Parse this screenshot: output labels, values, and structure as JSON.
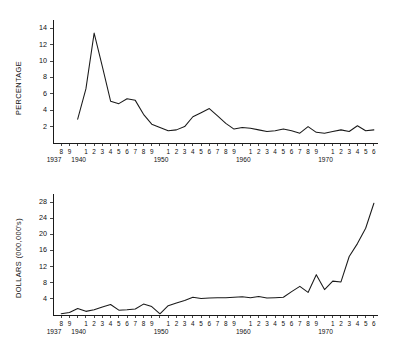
{
  "figure": {
    "background_color": "#ffffff",
    "line_color": "#1a1a1a",
    "axis_color": "#1a1a1a"
  },
  "chart_data": [
    {
      "id": "top",
      "type": "line",
      "title": "",
      "xlabel": "",
      "ylabel": "PERCENTAGE",
      "ylim": [
        0,
        15
      ],
      "xlim": [
        1937,
        1976.5
      ],
      "grid": false,
      "legend": null,
      "yticks": [
        2,
        4,
        6,
        8,
        10,
        12,
        14
      ],
      "ytick_labels": [
        "2",
        "4",
        "6",
        "8",
        "10",
        "12",
        "14"
      ],
      "x_tick_years": [
        1938,
        1939,
        1940,
        1941,
        1942,
        1943,
        1944,
        1945,
        1946,
        1947,
        1948,
        1949,
        1950,
        1951,
        1952,
        1953,
        1954,
        1955,
        1956,
        1957,
        1958,
        1959,
        1960,
        1961,
        1962,
        1963,
        1964,
        1965,
        1966,
        1967,
        1968,
        1969,
        1970,
        1971,
        1972,
        1973,
        1974,
        1975,
        1976
      ],
      "x_tick_labels": [
        "8",
        "9",
        "1940",
        "1",
        "2",
        "3",
        "4",
        "5",
        "6",
        "7",
        "8",
        "9",
        "1950",
        "1",
        "2",
        "3",
        "4",
        "5",
        "6",
        "7",
        "8",
        "9",
        "1960",
        "1",
        "2",
        "3",
        "4",
        "5",
        "6",
        "7",
        "8",
        "9",
        "1970",
        "1",
        "2",
        "3",
        "4",
        "5",
        "6"
      ],
      "x_digit_labels": [
        "8",
        "9",
        "",
        "1",
        "2",
        "3",
        "4",
        "5",
        "6",
        "7",
        "8",
        "9",
        "",
        "1",
        "2",
        "3",
        "4",
        "5",
        "6",
        "7",
        "8",
        "9",
        "",
        "1",
        "2",
        "3",
        "4",
        "5",
        "6",
        "7",
        "8",
        "9",
        "",
        "1",
        "2",
        "3",
        "4",
        "5",
        "6"
      ],
      "decade_anchors": [
        {
          "year": 1937,
          "label": "1937"
        },
        {
          "year": 1940,
          "label": "1940"
        },
        {
          "year": 1950,
          "label": "1950"
        },
        {
          "year": 1960,
          "label": "1960"
        },
        {
          "year": 1970,
          "label": "1970"
        }
      ],
      "x": [
        1940,
        1941,
        1942,
        1943,
        1944,
        1945,
        1946,
        1947,
        1948,
        1949,
        1950,
        1951,
        1952,
        1953,
        1954,
        1955,
        1956,
        1957,
        1958,
        1959,
        1960,
        1961,
        1962,
        1963,
        1964,
        1965,
        1966,
        1967,
        1968,
        1969,
        1970,
        1971,
        1972,
        1973,
        1974,
        1975,
        1976
      ],
      "values": [
        2.9,
        6.6,
        13.4,
        9.3,
        5.1,
        4.8,
        5.4,
        5.2,
        3.5,
        2.3,
        1.9,
        1.5,
        1.6,
        2.0,
        3.2,
        3.7,
        4.2,
        3.3,
        2.4,
        1.7,
        1.9,
        1.8,
        1.6,
        1.4,
        1.5,
        1.7,
        1.5,
        1.2,
        2.0,
        1.3,
        1.2,
        1.4,
        1.6,
        1.4,
        2.1,
        1.5,
        1.6
      ]
    },
    {
      "id": "bottom",
      "type": "line",
      "title": "",
      "xlabel": "",
      "ylabel": "DOLLARS (000,000's)",
      "ylim": [
        0,
        30
      ],
      "xlim": [
        1937,
        1976.5
      ],
      "grid": false,
      "legend": null,
      "yticks": [
        4,
        8,
        12,
        16,
        20,
        24,
        28
      ],
      "ytick_labels": [
        "4",
        "8",
        "12",
        "16",
        "20",
        "24",
        "28"
      ],
      "x_tick_years": [
        1938,
        1939,
        1940,
        1941,
        1942,
        1943,
        1944,
        1945,
        1946,
        1947,
        1948,
        1949,
        1950,
        1951,
        1952,
        1953,
        1954,
        1955,
        1956,
        1957,
        1958,
        1959,
        1960,
        1961,
        1962,
        1963,
        1964,
        1965,
        1966,
        1967,
        1968,
        1969,
        1970,
        1971,
        1972,
        1973,
        1974,
        1975,
        1976
      ],
      "x_digit_labels": [
        "8",
        "9",
        "",
        "1",
        "2",
        "3",
        "4",
        "5",
        "6",
        "7",
        "8",
        "9",
        "",
        "1",
        "2",
        "3",
        "4",
        "5",
        "6",
        "7",
        "8",
        "9",
        "",
        "1",
        "2",
        "3",
        "4",
        "5",
        "6",
        "7",
        "8",
        "9",
        "",
        "1",
        "2",
        "3",
        "4",
        "5",
        "6"
      ],
      "decade_anchors": [
        {
          "year": 1937,
          "label": "1937"
        },
        {
          "year": 1940,
          "label": "1940"
        },
        {
          "year": 1950,
          "label": "1950"
        },
        {
          "year": 1960,
          "label": "1960"
        },
        {
          "year": 1970,
          "label": "1970"
        }
      ],
      "x": [
        1938,
        1939,
        1940,
        1941,
        1942,
        1943,
        1944,
        1945,
        1946,
        1947,
        1948,
        1949,
        1950,
        1951,
        1952,
        1953,
        1954,
        1955,
        1956,
        1957,
        1958,
        1959,
        1960,
        1961,
        1962,
        1963,
        1964,
        1965,
        1966,
        1967,
        1968,
        1969,
        1970,
        1971,
        1972,
        1973,
        1974,
        1975,
        1976
      ],
      "values": [
        0.3,
        0.6,
        1.6,
        0.9,
        1.3,
        2.0,
        2.6,
        1.2,
        1.3,
        1.5,
        2.7,
        2.1,
        0.3,
        2.3,
        3.0,
        3.6,
        4.4,
        4.1,
        4.2,
        4.3,
        4.3,
        4.4,
        4.5,
        4.3,
        4.6,
        4.2,
        4.3,
        4.4,
        5.8,
        7.1,
        5.6,
        10.0,
        6.3,
        8.4,
        8.2,
        14.5,
        17.7,
        21.5,
        27.7
      ]
    }
  ]
}
